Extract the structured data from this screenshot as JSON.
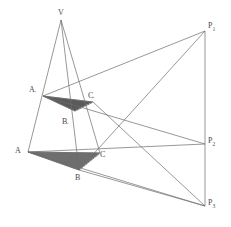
{
  "figure": {
    "background": "#ffffff",
    "stroke_color": "#6b6b6b",
    "stroke_width": 0.7,
    "fill_upper": "#5a5a5a",
    "fill_lower": "#6e6e6e",
    "label_color": "#4a4a4a"
  },
  "points": {
    "V": {
      "label": "V",
      "sub": "",
      "x": 61,
      "y": 20,
      "lx": 58,
      "ly": 9
    },
    "Ap": {
      "label": "A",
      "sub": "'",
      "x": 43,
      "y": 96,
      "lx": 29,
      "ly": 86
    },
    "Bp": {
      "label": "B",
      "sub": "'",
      "x": 75,
      "y": 111,
      "lx": 62,
      "ly": 118
    },
    "Cp": {
      "label": "C",
      "sub": "'",
      "x": 93,
      "y": 102,
      "lx": 88,
      "ly": 92
    },
    "A": {
      "label": "A",
      "sub": "",
      "x": 28,
      "y": 152,
      "lx": 15,
      "ly": 147
    },
    "B": {
      "label": "B",
      "sub": "",
      "x": 79,
      "y": 170,
      "lx": 75,
      "ly": 174
    },
    "C": {
      "label": "C",
      "sub": "",
      "x": 100,
      "y": 153,
      "lx": 100,
      "ly": 151
    },
    "P1": {
      "label": "P",
      "sub": "1",
      "x": 205,
      "y": 31,
      "lx": 208,
      "ly": 22
    },
    "P2": {
      "label": "P",
      "sub": "2",
      "x": 205,
      "y": 144,
      "lx": 208,
      "ly": 137
    },
    "P3": {
      "label": "P",
      "sub": "3",
      "x": 205,
      "y": 206,
      "lx": 208,
      "ly": 199
    }
  },
  "triangles": [
    {
      "name": "upper-shaded-triangle",
      "vertices": "Ap,Cp,Bp",
      "fill": "#5a5a5a"
    },
    {
      "name": "lower-shaded-triangle",
      "vertices": "A,C,B",
      "fill": "#6e6e6e"
    }
  ],
  "edges": [
    {
      "name": "edge-V-A",
      "from": "V",
      "to": "A"
    },
    {
      "name": "edge-V-B",
      "from": "V",
      "to": "B"
    },
    {
      "name": "edge-V-C",
      "from": "V",
      "to": "C"
    },
    {
      "name": "edge-Ap-Cp",
      "from": "Ap",
      "to": "Cp"
    },
    {
      "name": "edge-Cp-Bp",
      "from": "Cp",
      "to": "Bp"
    },
    {
      "name": "edge-Bp-Ap",
      "from": "Bp",
      "to": "Ap"
    },
    {
      "name": "edge-A-C",
      "from": "A",
      "to": "C"
    },
    {
      "name": "edge-C-B",
      "from": "C",
      "to": "B"
    },
    {
      "name": "edge-B-A",
      "from": "B",
      "to": "A"
    },
    {
      "name": "edge-P1-P2",
      "from": "P1",
      "to": "P2"
    },
    {
      "name": "edge-P2-P3",
      "from": "P2",
      "to": "P3"
    },
    {
      "name": "ray-P1-Ap",
      "from": "P1",
      "to": "Ap"
    },
    {
      "name": "ray-P1-B",
      "from": "P1",
      "to": "B"
    },
    {
      "name": "ray-P2-Ap",
      "from": "P2",
      "to": "Ap"
    },
    {
      "name": "ray-P2-A",
      "from": "P2",
      "to": "A"
    },
    {
      "name": "ray-P3-Cp",
      "from": "P3",
      "to": "Cp"
    },
    {
      "name": "ray-P3-A",
      "from": "P3",
      "to": "A"
    },
    {
      "name": "ray-P3-B",
      "from": "P3",
      "to": "B"
    }
  ],
  "dashed_edges": [
    {
      "name": "dashed-Cp-Bp-inner",
      "from": "Cp",
      "to": "Bp"
    },
    {
      "name": "dashed-C-B-inner",
      "from": "C",
      "to": "B"
    }
  ]
}
